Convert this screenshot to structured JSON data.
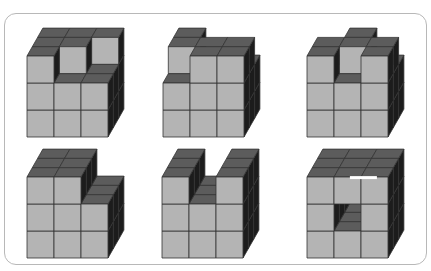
{
  "colors": {
    "front": "#b4b4b4",
    "top": "#5c5c5c",
    "side": "#1c1c1c",
    "edge": "#333333",
    "frame": "#b8b8b8",
    "hole_light": "#ffffff"
  },
  "geometry": {
    "cell": 27,
    "depth_dx": 5.3,
    "depth_dy": -9.3
  },
  "figures": [
    {
      "label": "figure-1",
      "origin": [
        27,
        137
      ],
      "heights": [
        [
          3,
          3,
          3
        ],
        [
          2,
          3,
          3
        ],
        [
          2,
          2,
          3
        ]
      ]
    },
    {
      "label": "figure-2",
      "origin": [
        163,
        137
      ],
      "heights": [
        [
          2,
          3,
          3
        ],
        [
          3,
          3,
          2
        ],
        [
          3,
          3,
          2
        ]
      ]
    },
    {
      "label": "figure-3",
      "origin": [
        307,
        137
      ],
      "heights": [
        [
          3,
          3,
          2
        ],
        [
          2,
          3,
          3
        ],
        [
          3,
          3,
          2
        ]
      ]
    },
    {
      "label": "figure-4",
      "origin": [
        27,
        258
      ],
      "heights": [
        [
          3,
          3,
          3
        ],
        [
          3,
          3,
          3
        ],
        [
          2,
          2,
          2
        ]
      ]
    },
    {
      "label": "figure-5",
      "origin": [
        162,
        258
      ],
      "heights": [
        [
          3,
          3,
          3
        ],
        [
          2,
          2,
          2
        ],
        [
          3,
          3,
          3
        ]
      ]
    },
    {
      "label": "figure-6",
      "origin": [
        307,
        258
      ],
      "heights": [
        [
          3,
          3,
          3
        ],
        [
          3,
          3,
          3
        ],
        [
          3,
          3,
          3
        ]
      ],
      "tunnel": {
        "x": 1,
        "y": 1
      }
    }
  ]
}
